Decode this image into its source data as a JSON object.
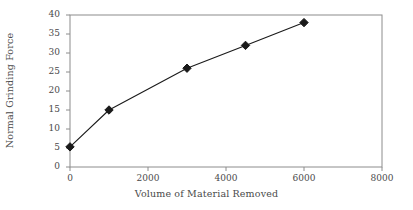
{
  "chart_data": {
    "type": "line",
    "title": "",
    "xlabel": "Volume of Material Removed",
    "ylabel": "Normal Grinding Force",
    "x": [
      0,
      1000,
      3000,
      4500,
      6000
    ],
    "values": [
      5.3,
      15,
      26,
      32,
      38
    ],
    "series": [
      {
        "name": "Normal Grinding Force",
        "x": [
          0,
          1000,
          3000,
          4500,
          6000
        ],
        "values": [
          5.3,
          15,
          26,
          32,
          38
        ]
      }
    ],
    "xlim": [
      0,
      8000
    ],
    "ylim": [
      0,
      40
    ],
    "xticks": [
      0,
      2000,
      4000,
      6000,
      8000
    ],
    "yticks": [
      0,
      5,
      10,
      15,
      20,
      25,
      30,
      35,
      40
    ],
    "xtick_labels": [
      "0",
      "2000",
      "4000",
      "6000",
      "8000"
    ],
    "ytick_labels": [
      "0",
      "5",
      "10",
      "15",
      "20",
      "25",
      "30",
      "35",
      "40"
    ],
    "grid": false,
    "legend": null,
    "marker": "diamond",
    "line_color": "#1a1a1a",
    "marker_color": "#1a1a1a",
    "axis_color": "#8c8c8c",
    "background": "#ffffff"
  }
}
